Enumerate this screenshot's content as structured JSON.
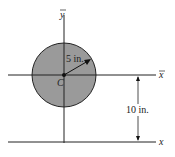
{
  "diagram": {
    "labels": {
      "y_bar": "y",
      "x_bar": "x",
      "x": "x",
      "centroid": "C",
      "radius": "5 in.",
      "distance": "10 in."
    },
    "colors": {
      "circle_fill": "#9a9a9a",
      "line": "#222222"
    }
  }
}
